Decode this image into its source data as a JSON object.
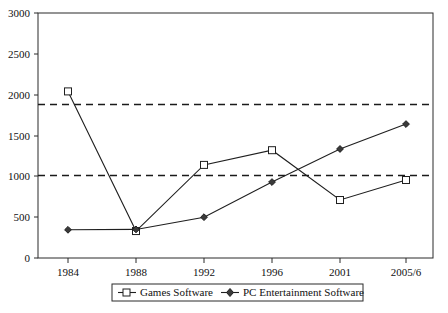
{
  "chart_data": {
    "type": "line",
    "title": "",
    "xlabel": "",
    "ylabel": "",
    "categories": [
      "1984",
      "1988",
      "1992",
      "1996",
      "2001",
      "2005/6"
    ],
    "ylim": [
      0,
      3000
    ],
    "yticks": [
      "0",
      "500",
      "1000",
      "1500",
      "2000",
      "2500",
      "3000"
    ],
    "ytick_values": [
      0,
      500,
      1000,
      1500,
      2000,
      2500,
      3000
    ],
    "grid": false,
    "legend_position": "bottom",
    "series": [
      {
        "name": "Games Software",
        "marker": "square",
        "values": [
          2040,
          330,
          1140,
          1320,
          710,
          955
        ]
      },
      {
        "name": "PC Entertainment Software",
        "marker": "diamond",
        "values": [
          345,
          350,
          500,
          930,
          1335,
          1640
        ]
      }
    ],
    "reference_lines": [
      {
        "name": "upper-reference-line",
        "value": 1880,
        "style": "dashed"
      },
      {
        "name": "lower-reference-line",
        "value": 1010,
        "style": "dashed"
      }
    ]
  },
  "legend": {
    "entries": [
      {
        "label": "Games Software"
      },
      {
        "label": "PC Entertainment Software"
      }
    ]
  }
}
